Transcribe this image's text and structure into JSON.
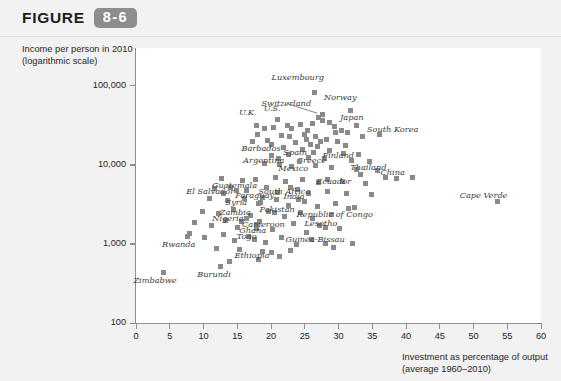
{
  "header": {
    "figure_word": "FIGURE",
    "figure_number": "8-6"
  },
  "chart_data": {
    "type": "scatter",
    "title": "",
    "xlabel": "Investment as percentage of output (average 1960-2010)",
    "xlabel_line1": "Investment as percentage of output",
    "xlabel_line2": "(average 1960–2010)",
    "ylabel": "Income per person in 2010 (logarithmic scale)",
    "ylabel_line1": "Income per person in 2010",
    "ylabel_line2": "(logarithmic scale)",
    "grid": false,
    "legend": "none",
    "marker_color": "#8a8a8a",
    "xlim": [
      0,
      60
    ],
    "ylim": [
      100,
      300000
    ],
    "yscale": "log",
    "xticks": [
      0,
      5,
      10,
      15,
      20,
      25,
      30,
      35,
      40,
      45,
      50,
      55,
      60
    ],
    "xtick_labels": [
      "0",
      "5",
      "10",
      "15",
      "20",
      "25",
      "30",
      "35",
      "40",
      "45",
      "50",
      "55",
      "60"
    ],
    "yticks": [
      100,
      1000,
      10000,
      100000
    ],
    "ytick_labels": [
      "100",
      "1,000",
      "10,000",
      "100,000"
    ],
    "labeled_points": [
      {
        "name": "Luxembourg",
        "x": 26.4,
        "y": 82000,
        "lx": 24.0,
        "ly": 130000
      },
      {
        "name": "Norway",
        "x": 31.8,
        "y": 48000,
        "lx": 30.3,
        "ly": 72000
      },
      {
        "name": "Switzerland",
        "x": 27.6,
        "y": 43000,
        "lx": 22.3,
        "ly": 60000
      },
      {
        "name": "Japan",
        "x": 32.6,
        "y": 31000,
        "lx": 32.0,
        "ly": 40000
      },
      {
        "name": "U.S.",
        "x": 21.0,
        "y": 37000,
        "lx": 20.2,
        "ly": 52000
      },
      {
        "name": "U.K.",
        "x": 17.9,
        "y": 31000,
        "lx": 16.5,
        "ly": 46000
      },
      {
        "name": "South Korea",
        "x": 36.1,
        "y": 24000,
        "lx": 38.0,
        "ly": 28000
      },
      {
        "name": "Finland",
        "x": 29.5,
        "y": 26000,
        "lx": 30.0,
        "ly": 13500
      },
      {
        "name": "Barbados",
        "x": 20.0,
        "y": 18000,
        "lx": 18.5,
        "ly": 16500
      },
      {
        "name": "Spain",
        "x": 25.2,
        "y": 21000,
        "lx": 23.6,
        "ly": 14500
      },
      {
        "name": "Greece",
        "x": 26.9,
        "y": 17000,
        "lx": 26.0,
        "ly": 11500
      },
      {
        "name": "Argentina",
        "x": 21.1,
        "y": 12000,
        "lx": 18.9,
        "ly": 11500
      },
      {
        "name": "Mexico",
        "x": 24.2,
        "y": 11000,
        "lx": 23.3,
        "ly": 9000
      },
      {
        "name": "Thailand",
        "x": 33.3,
        "y": 7500,
        "lx": 34.4,
        "ly": 9500
      },
      {
        "name": "China",
        "x": 36.9,
        "y": 7000,
        "lx": 38.0,
        "ly": 8200
      },
      {
        "name": "Ecuador",
        "x": 28.4,
        "y": 6500,
        "lx": 29.3,
        "ly": 6200
      },
      {
        "name": "Guatemala",
        "x": 14.9,
        "y": 4800,
        "lx": 14.6,
        "ly": 5600
      },
      {
        "name": "South Africa",
        "x": 22.9,
        "y": 5200,
        "lx": 22.0,
        "ly": 4600
      },
      {
        "name": "El Salvador",
        "x": 13.0,
        "y": 4400,
        "lx": 11.0,
        "ly": 4600
      },
      {
        "name": "Paraguay",
        "x": 18.7,
        "y": 3900,
        "lx": 17.6,
        "ly": 4200
      },
      {
        "name": "India",
        "x": 24.0,
        "y": 3600,
        "lx": 23.4,
        "ly": 4000
      },
      {
        "name": "Syria",
        "x": 18.1,
        "y": 3200,
        "lx": 14.9,
        "ly": 3400
      },
      {
        "name": "Cape Verde",
        "x": 53.5,
        "y": 3400,
        "lx": 51.5,
        "ly": 4200
      },
      {
        "name": "Pakistan",
        "x": 20.5,
        "y": 2500,
        "lx": 20.9,
        "ly": 2800
      },
      {
        "name": "Zambia",
        "x": 16.4,
        "y": 2100,
        "lx": 14.7,
        "ly": 2500
      },
      {
        "name": "Nigeria",
        "x": 15.6,
        "y": 1900,
        "lx": 13.6,
        "ly": 2100
      },
      {
        "name": "Ghana",
        "x": 17.9,
        "y": 1550,
        "lx": 17.3,
        "ly": 1500
      },
      {
        "name": "Cameroon",
        "x": 17.8,
        "y": 1750,
        "lx": 18.9,
        "ly": 1800
      },
      {
        "name": "Republic of Congo",
        "x": 31.5,
        "y": 2800,
        "lx": 29.4,
        "ly": 2400
      },
      {
        "name": "Lesotho",
        "x": 28.1,
        "y": 1600,
        "lx": 27.4,
        "ly": 1850
      },
      {
        "name": "Togo",
        "x": 17.6,
        "y": 1150,
        "lx": 16.4,
        "ly": 1250
      },
      {
        "name": "Guinea-Bissau",
        "x": 28.0,
        "y": 1000,
        "lx": 26.5,
        "ly": 1150
      },
      {
        "name": "Rwanda",
        "x": 7.6,
        "y": 1250,
        "lx": 6.3,
        "ly": 1000
      },
      {
        "name": "Ethiopia",
        "x": 18.8,
        "y": 800,
        "lx": 17.2,
        "ly": 720
      },
      {
        "name": "Burundi",
        "x": 12.5,
        "y": 520,
        "lx": 11.6,
        "ly": 420
      },
      {
        "name": "Zimbabwe",
        "x": 4.0,
        "y": 430,
        "lx": 2.8,
        "ly": 350
      }
    ],
    "unlabeled_points": [
      {
        "x": 27.0,
        "y": 40000
      },
      {
        "x": 27.6,
        "y": 36000
      },
      {
        "x": 28.6,
        "y": 34000
      },
      {
        "x": 26.1,
        "y": 33000
      },
      {
        "x": 24.3,
        "y": 32000
      },
      {
        "x": 22.4,
        "y": 31500
      },
      {
        "x": 20.4,
        "y": 30000
      },
      {
        "x": 19.1,
        "y": 28500
      },
      {
        "x": 23.1,
        "y": 29000
      },
      {
        "x": 25.4,
        "y": 27500
      },
      {
        "x": 29.4,
        "y": 30500
      },
      {
        "x": 30.4,
        "y": 27000
      },
      {
        "x": 31.4,
        "y": 25500
      },
      {
        "x": 33.5,
        "y": 23000
      },
      {
        "x": 18.0,
        "y": 24000
      },
      {
        "x": 21.5,
        "y": 23500
      },
      {
        "x": 22.8,
        "y": 22500
      },
      {
        "x": 24.9,
        "y": 24500
      },
      {
        "x": 26.6,
        "y": 23000
      },
      {
        "x": 28.2,
        "y": 21000
      },
      {
        "x": 17.2,
        "y": 19500
      },
      {
        "x": 19.5,
        "y": 20500
      },
      {
        "x": 23.6,
        "y": 19000
      },
      {
        "x": 25.9,
        "y": 18000
      },
      {
        "x": 27.4,
        "y": 19500
      },
      {
        "x": 29.9,
        "y": 20000
      },
      {
        "x": 31.0,
        "y": 17500
      },
      {
        "x": 21.9,
        "y": 16500
      },
      {
        "x": 24.6,
        "y": 15500
      },
      {
        "x": 26.3,
        "y": 14500
      },
      {
        "x": 28.7,
        "y": 15000
      },
      {
        "x": 30.8,
        "y": 14000
      },
      {
        "x": 33.0,
        "y": 13500
      },
      {
        "x": 20.1,
        "y": 13000
      },
      {
        "x": 22.6,
        "y": 13500
      },
      {
        "x": 25.6,
        "y": 12500
      },
      {
        "x": 27.9,
        "y": 12000
      },
      {
        "x": 31.9,
        "y": 11500
      },
      {
        "x": 34.6,
        "y": 11000
      },
      {
        "x": 19.0,
        "y": 10500
      },
      {
        "x": 21.3,
        "y": 10000
      },
      {
        "x": 23.0,
        "y": 9500
      },
      {
        "x": 26.6,
        "y": 9800
      },
      {
        "x": 29.0,
        "y": 9200
      },
      {
        "x": 32.6,
        "y": 8800
      },
      {
        "x": 35.8,
        "y": 8500
      },
      {
        "x": 12.6,
        "y": 6800
      },
      {
        "x": 15.8,
        "y": 6400
      },
      {
        "x": 17.7,
        "y": 6600
      },
      {
        "x": 20.6,
        "y": 6900
      },
      {
        "x": 22.2,
        "y": 6200
      },
      {
        "x": 24.7,
        "y": 6600
      },
      {
        "x": 27.1,
        "y": 5900
      },
      {
        "x": 30.6,
        "y": 6100
      },
      {
        "x": 34.0,
        "y": 5800
      },
      {
        "x": 38.6,
        "y": 6700
      },
      {
        "x": 40.9,
        "y": 6900
      },
      {
        "x": 11.6,
        "y": 5000
      },
      {
        "x": 14.0,
        "y": 5200
      },
      {
        "x": 16.4,
        "y": 4700
      },
      {
        "x": 19.4,
        "y": 5100
      },
      {
        "x": 21.0,
        "y": 4500
      },
      {
        "x": 23.9,
        "y": 4900
      },
      {
        "x": 25.5,
        "y": 4300
      },
      {
        "x": 28.3,
        "y": 4600
      },
      {
        "x": 31.2,
        "y": 4400
      },
      {
        "x": 34.9,
        "y": 4200
      },
      {
        "x": 10.9,
        "y": 3700
      },
      {
        "x": 13.6,
        "y": 3500
      },
      {
        "x": 16.0,
        "y": 3800
      },
      {
        "x": 18.5,
        "y": 3300
      },
      {
        "x": 20.8,
        "y": 3600
      },
      {
        "x": 22.6,
        "y": 3100
      },
      {
        "x": 25.0,
        "y": 3400
      },
      {
        "x": 26.9,
        "y": 3000
      },
      {
        "x": 29.6,
        "y": 3200
      },
      {
        "x": 32.4,
        "y": 2900
      },
      {
        "x": 9.9,
        "y": 2600
      },
      {
        "x": 12.2,
        "y": 2400
      },
      {
        "x": 14.4,
        "y": 2700
      },
      {
        "x": 16.9,
        "y": 2300
      },
      {
        "x": 19.7,
        "y": 2600
      },
      {
        "x": 22.0,
        "y": 2200
      },
      {
        "x": 24.4,
        "y": 2500
      },
      {
        "x": 26.2,
        "y": 2100
      },
      {
        "x": 28.9,
        "y": 2350
      },
      {
        "x": 8.6,
        "y": 1850
      },
      {
        "x": 11.2,
        "y": 1700
      },
      {
        "x": 13.2,
        "y": 1950
      },
      {
        "x": 15.0,
        "y": 1600
      },
      {
        "x": 18.3,
        "y": 1900
      },
      {
        "x": 20.2,
        "y": 1500
      },
      {
        "x": 23.3,
        "y": 1800
      },
      {
        "x": 25.2,
        "y": 1400
      },
      {
        "x": 27.2,
        "y": 1700
      },
      {
        "x": 30.2,
        "y": 1550
      },
      {
        "x": 7.9,
        "y": 1350
      },
      {
        "x": 10.2,
        "y": 1200
      },
      {
        "x": 12.9,
        "y": 1300
      },
      {
        "x": 14.6,
        "y": 1100
      },
      {
        "x": 16.6,
        "y": 1250
      },
      {
        "x": 19.2,
        "y": 1050
      },
      {
        "x": 21.6,
        "y": 1200
      },
      {
        "x": 23.8,
        "y": 980
      },
      {
        "x": 26.0,
        "y": 1150
      },
      {
        "x": 29.2,
        "y": 900
      },
      {
        "x": 32.0,
        "y": 1000
      },
      {
        "x": 11.9,
        "y": 880
      },
      {
        "x": 15.4,
        "y": 860
      },
      {
        "x": 20.0,
        "y": 780
      },
      {
        "x": 22.9,
        "y": 820
      },
      {
        "x": 13.9,
        "y": 600
      },
      {
        "x": 18.2,
        "y": 640
      },
      {
        "x": 21.2,
        "y": 700
      }
    ]
  }
}
